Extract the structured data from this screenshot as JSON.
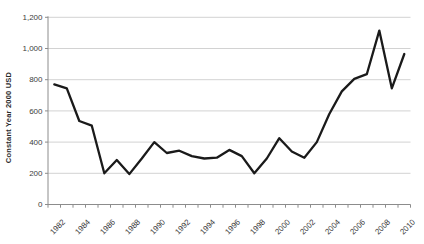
{
  "chart_data": {
    "type": "line",
    "title": "",
    "ylabel": "Constant Year 2000 USD",
    "xlabel": "",
    "x": [
      1982,
      1983,
      1984,
      1985,
      1986,
      1987,
      1988,
      1989,
      1990,
      1991,
      1992,
      1993,
      1994,
      1995,
      1996,
      1997,
      1998,
      1999,
      2000,
      2001,
      2002,
      2003,
      2004,
      2005,
      2006,
      2007,
      2008,
      2009,
      2010
    ],
    "values": [
      770,
      745,
      535,
      505,
      200,
      285,
      195,
      295,
      400,
      330,
      345,
      310,
      295,
      300,
      350,
      310,
      200,
      295,
      425,
      340,
      300,
      400,
      580,
      725,
      805,
      835,
      1115,
      745,
      965
    ],
    "ylim": [
      0,
      1200
    ],
    "ytick_step": 200,
    "ytick_labels": [
      "0",
      "200",
      "400",
      "600",
      "800",
      "1,000",
      "1,200"
    ],
    "xtick_labels": [
      "1982",
      "1984",
      "1986",
      "1988",
      "1990",
      "1992",
      "1994",
      "1996",
      "1998",
      "2000",
      "2002",
      "2004",
      "2006",
      "2008",
      "2010"
    ],
    "xtick_every": 2,
    "grid": "horizontal",
    "legend": "none",
    "colors": {
      "line": "#1a1a1a",
      "gridline": "#c6c6c6",
      "axis": "#8c8c8c",
      "tick_label": "#3d3d3d",
      "background": "#ffffff"
    }
  }
}
